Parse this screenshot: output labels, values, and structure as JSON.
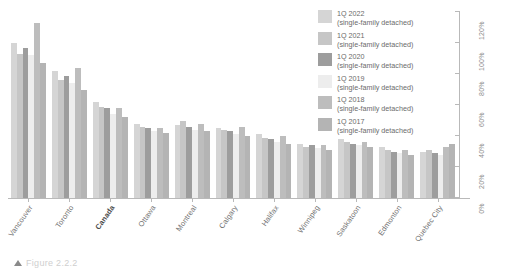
{
  "figure": {
    "caption_marker": "triangle-marker",
    "caption_text": "Figure 2.2.2"
  },
  "legend": {
    "position": "top-right",
    "items": [
      {
        "label": "1Q 2022",
        "sublabel": "(single-family detached)",
        "color": "#d5d5d5"
      },
      {
        "label": "1Q 2021",
        "sublabel": "(single-family detached)",
        "color": "#c6c6c6"
      },
      {
        "label": "1Q 2020",
        "sublabel": "(single-family detached)",
        "color": "#9d9d9d"
      },
      {
        "label": "1Q 2019",
        "sublabel": "(single-family detached)",
        "color": "#ededed"
      },
      {
        "label": "1Q 2018",
        "sublabel": "(single-family detached)",
        "color": "#bdbdbd"
      },
      {
        "label": "1Q 2017",
        "sublabel": "(single-family detached)",
        "color": "#b4b4b4"
      }
    ]
  },
  "chart_data": {
    "type": "bar",
    "title": "",
    "xlabel": "",
    "ylabel": "",
    "ylim": [
      0,
      120
    ],
    "grid": false,
    "legend_position": "top-right",
    "y_ticks": [
      "0%",
      "20%",
      "40%",
      "60%",
      "80%",
      "100%",
      "120%"
    ],
    "y_tick_values": [
      0,
      20,
      40,
      60,
      80,
      100,
      120
    ],
    "categories": [
      "Vancouver",
      "Toronto",
      "Canada",
      "Ottawa",
      "Montreal",
      "Calgary",
      "Halifax",
      "Winnipeg",
      "Saskatoon",
      "Edmonton",
      "Quebec City"
    ],
    "highlighted_category": "Canada",
    "series": [
      {
        "name": "1Q 2022",
        "color": "#d5d5d5",
        "values": [
          100,
          82,
          62,
          48,
          47,
          45,
          41,
          35,
          38,
          33,
          30
        ]
      },
      {
        "name": "1Q 2021",
        "color": "#c6c6c6",
        "values": [
          93,
          76,
          59,
          46,
          50,
          44,
          39,
          33,
          36,
          31,
          31
        ]
      },
      {
        "name": "1Q 2020",
        "color": "#9d9d9d",
        "values": [
          97,
          79,
          58,
          45,
          46,
          43,
          38,
          34,
          35,
          30,
          29
        ]
      },
      {
        "name": "1Q 2019",
        "color": "#ededed",
        "values": [
          92,
          74,
          54,
          43,
          44,
          41,
          36,
          32,
          34,
          29,
          28
        ]
      },
      {
        "name": "1Q 2018",
        "color": "#bdbdbd",
        "values": [
          113,
          84,
          58,
          45,
          48,
          46,
          40,
          34,
          36,
          31,
          33
        ]
      },
      {
        "name": "1Q 2017",
        "color": "#b4b4b4",
        "values": [
          87,
          70,
          52,
          42,
          43,
          40,
          35,
          31,
          33,
          28,
          35
        ]
      }
    ]
  }
}
